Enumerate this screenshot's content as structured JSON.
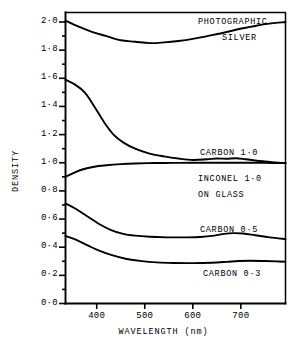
{
  "chart_data": {
    "type": "line",
    "title": "",
    "xlabel": "WAVELENGTH (nm)",
    "ylabel": "DENSITY",
    "xlim": [
      335,
      793
    ],
    "ylim": [
      0.0,
      2.1
    ],
    "grid": false,
    "legend_position": "inline-annotations",
    "xticks": [
      400,
      500,
      600,
      700
    ],
    "xtick_labels": [
      "400",
      "500",
      "600",
      "700"
    ],
    "yticks": [
      0.0,
      0.2,
      0.4,
      0.6,
      0.8,
      1.0,
      1.2,
      1.4,
      1.6,
      1.8,
      2.0
    ],
    "ytick_labels": [
      "0·0",
      "0·2",
      "0·4",
      "0·6",
      "0·8",
      "1·0",
      "1·2",
      "1·4",
      "1·6",
      "1·8",
      "2·0"
    ],
    "yminor_ticks": [
      0.1,
      0.3,
      0.5,
      0.7,
      0.9,
      1.1,
      1.3,
      1.5,
      1.7,
      1.9
    ],
    "series": [
      {
        "name": "PHOTOGRAPHIC SILVER",
        "label_lines": [
          "PHOTOGRAPHIC",
          "SILVER"
        ],
        "x": [
          335,
          360,
          390,
          420,
          450,
          480,
          510,
          540,
          570,
          600,
          630,
          660,
          690,
          720,
          750,
          793
        ],
        "values": [
          2.01,
          1.97,
          1.93,
          1.9,
          1.87,
          1.86,
          1.85,
          1.855,
          1.865,
          1.88,
          1.9,
          1.92,
          1.945,
          1.965,
          1.985,
          2.0
        ]
      },
      {
        "name": "CARBON 1·0",
        "label_lines": [
          "CARBON 1·0"
        ],
        "x": [
          335,
          355,
          375,
          395,
          415,
          435,
          455,
          480,
          510,
          540,
          570,
          600,
          630,
          650,
          670,
          690,
          710,
          740,
          770,
          793
        ],
        "values": [
          1.59,
          1.555,
          1.5,
          1.4,
          1.29,
          1.2,
          1.145,
          1.1,
          1.065,
          1.045,
          1.03,
          1.02,
          1.025,
          1.03,
          1.028,
          1.032,
          1.025,
          1.012,
          1.002,
          0.998
        ]
      },
      {
        "name": "INCONEL 1·0 ON GLASS",
        "label_lines": [
          "INCONEL 1·0",
          "ON GLASS"
        ],
        "x": [
          335,
          350,
          370,
          395,
          420,
          450,
          480,
          520,
          560,
          600,
          650,
          700,
          750,
          793
        ],
        "values": [
          0.9,
          0.925,
          0.952,
          0.972,
          0.982,
          0.99,
          0.995,
          0.998,
          0.999,
          1.0,
          1.0,
          1.0,
          0.999,
          0.998
        ]
      },
      {
        "name": "CARBON 0·5",
        "label_lines": [
          "CARBON 0·5"
        ],
        "x": [
          335,
          355,
          380,
          405,
          430,
          455,
          480,
          510,
          545,
          580,
          615,
          645,
          665,
          685,
          705,
          730,
          760,
          793
        ],
        "values": [
          0.71,
          0.675,
          0.62,
          0.565,
          0.522,
          0.495,
          0.482,
          0.474,
          0.47,
          0.47,
          0.472,
          0.482,
          0.495,
          0.5,
          0.497,
          0.485,
          0.47,
          0.458
        ]
      },
      {
        "name": "CARBON 0·3",
        "label_lines": [
          "CARBON 0·3"
        ],
        "x": [
          335,
          355,
          380,
          405,
          430,
          460,
          490,
          525,
          560,
          600,
          640,
          670,
          695,
          720,
          750,
          775,
          793
        ],
        "values": [
          0.48,
          0.455,
          0.415,
          0.375,
          0.345,
          0.318,
          0.303,
          0.292,
          0.288,
          0.287,
          0.29,
          0.296,
          0.302,
          0.304,
          0.302,
          0.299,
          0.297
        ]
      }
    ],
    "annotations": [
      {
        "text": "PHOTOGRAPHIC",
        "series": "PHOTOGRAPHIC SILVER"
      },
      {
        "text": "SILVER",
        "series": "PHOTOGRAPHIC SILVER"
      },
      {
        "text": "CARBON 1·0",
        "series": "CARBON 1·0"
      },
      {
        "text": "INCONEL 1·0",
        "series": "INCONEL 1·0 ON GLASS"
      },
      {
        "text": "ON GLASS",
        "series": "INCONEL 1·0 ON GLASS"
      },
      {
        "text": "CARBON 0·5",
        "series": "CARBON 0·5"
      },
      {
        "text": "CARBON 0·3",
        "series": "CARBON 0·3"
      }
    ]
  },
  "labels": {
    "photographic": "PHOTOGRAPHIC",
    "silver": "SILVER",
    "carbon_10": "CARBON 1·0",
    "inconel_10": "INCONEL 1·0",
    "on_glass": "ON GLASS",
    "carbon_05": "CARBON 0·5",
    "carbon_03": "CARBON 0·3"
  }
}
